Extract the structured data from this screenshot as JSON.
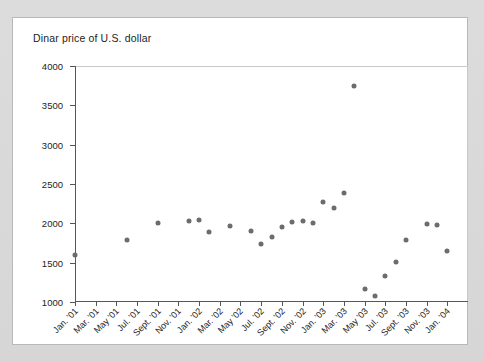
{
  "card": {
    "title": "Dinar price of U.S. dollar"
  },
  "chart_data": {
    "type": "scatter",
    "title": "Dinar price of U.S. dollar",
    "xlabel": "",
    "ylabel": "",
    "ylim": [
      1000,
      4000
    ],
    "ytick_step": 500,
    "ytick_labels": [
      "1000",
      "1500",
      "2000",
      "2500",
      "3000",
      "3500",
      "4000"
    ],
    "grid": false,
    "legend": null,
    "marker_color": "#6b6b70",
    "x_tick_labels": [
      "Jan. '01",
      "Mar. '01",
      "May '01",
      "Jul. '01",
      "Sept. '01",
      "Nov. '01",
      "Jan. '02",
      "Mar. '02",
      "May '02",
      "Jul. '02",
      "Sept. '02",
      "Nov. '02",
      "Jan. '03",
      "Mar. '03",
      "May '03",
      "Jul. '03",
      "Sept. '03",
      "Nov. '03",
      "Jan. '04"
    ],
    "x_tick_months": [
      0,
      2,
      4,
      6,
      8,
      10,
      12,
      14,
      16,
      18,
      20,
      22,
      24,
      26,
      28,
      30,
      32,
      34,
      36
    ],
    "xlim_months": [
      0,
      38
    ],
    "points": [
      {
        "label": "Jan. '01",
        "month": 0,
        "value": 1600
      },
      {
        "label": "Jun. '01",
        "month": 5,
        "value": 1790
      },
      {
        "label": "Sept. '01",
        "month": 8,
        "value": 2000
      },
      {
        "label": "Dec. '01",
        "month": 11,
        "value": 2030
      },
      {
        "label": "Jan. '02",
        "month": 12,
        "value": 2045
      },
      {
        "label": "Feb. '02",
        "month": 13,
        "value": 1890
      },
      {
        "label": "Apr. '02",
        "month": 15,
        "value": 1960
      },
      {
        "label": "Jun. '02",
        "month": 17,
        "value": 1900
      },
      {
        "label": "Jul. '02",
        "month": 18,
        "value": 1735
      },
      {
        "label": "Aug. '02",
        "month": 19,
        "value": 1830
      },
      {
        "label": "Sept. '02",
        "month": 20,
        "value": 1950
      },
      {
        "label": "Oct. '02",
        "month": 21,
        "value": 2020
      },
      {
        "label": "Nov. '02",
        "month": 22,
        "value": 2025
      },
      {
        "label": "Dec. '02",
        "month": 23,
        "value": 2010
      },
      {
        "label": "Jan. '03",
        "month": 24,
        "value": 2270
      },
      {
        "label": "Feb. '03",
        "month": 25,
        "value": 2190
      },
      {
        "label": "Mar. '03",
        "month": 26,
        "value": 2380
      },
      {
        "label": "Apr. '03",
        "month": 27,
        "value": 3750
      },
      {
        "label": "May '03",
        "month": 28,
        "value": 1160
      },
      {
        "label": "Jun. '03",
        "month": 29,
        "value": 1080
      },
      {
        "label": "Jul. '03",
        "month": 30,
        "value": 1330
      },
      {
        "label": "Aug. '03",
        "month": 31,
        "value": 1510
      },
      {
        "label": "Sept. '03",
        "month": 32,
        "value": 1790
      },
      {
        "label": "Nov. '03",
        "month": 34,
        "value": 1990
      },
      {
        "label": "Dec. '03",
        "month": 35,
        "value": 1975
      },
      {
        "label": "Jan. '04",
        "month": 36,
        "value": 1650
      }
    ]
  }
}
